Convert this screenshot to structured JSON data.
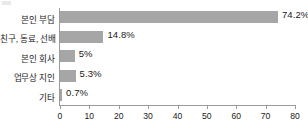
{
  "chart_data": {
    "type": "bar",
    "orientation": "horizontal",
    "title": "",
    "subtitle": "",
    "xlabel": "",
    "ylabel": "",
    "categories": [
      "본인 부담",
      "친구, 동료, 선배",
      "본인 회사",
      "업무상 지인",
      "기타"
    ],
    "values": [
      74.2,
      14.8,
      5,
      5.3,
      0.7
    ],
    "value_labels": [
      "74.2%",
      "14.8%",
      "5%",
      "5.3%",
      "0.7%"
    ],
    "xlim": [
      0,
      80
    ],
    "xticks": [
      0,
      10,
      20,
      30,
      40,
      50,
      60,
      70,
      80
    ],
    "xtick_labels": [
      "0",
      "10",
      "20",
      "30",
      "40",
      "50",
      "60",
      "70",
      "80"
    ],
    "grid": false,
    "legend": false,
    "series": [
      {
        "name": "",
        "values": [
          74.2,
          14.8,
          5,
          5.3,
          0.7
        ]
      }
    ],
    "colors": {
      "bar": "#a6a6a6",
      "axis": "#9a9a9a",
      "text": "#1a1a1a",
      "background": "#ffffff"
    }
  }
}
